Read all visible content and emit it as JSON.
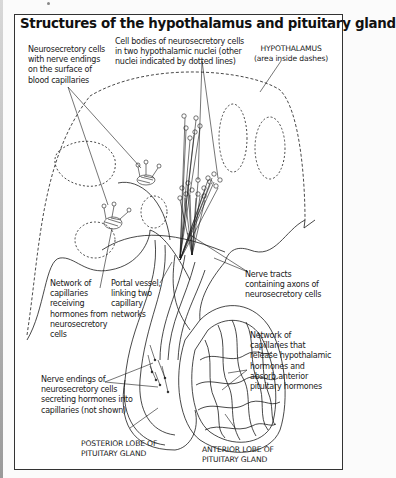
{
  "figure": {
    "title": "Structures of the hypothalamus and pituitary gland",
    "labels": {
      "neurosecretory_cells": "Neurosecretory cells\nwith nerve endings\non the surface of\nblood capillaries",
      "cell_bodies": "Cell bodies of neurosecretory cells\nin two hypothalamic nuclei (other\nnuclei indicated by dotted lines)",
      "hypothalamus": "HYPOTHALAMUS\n(area inside dashes)",
      "network_receiving": "Network of\ncapillaries\nreceiving\nhormones from\nneurosecretory\ncells",
      "portal_vessel": "Portal vessel,\nlinking two\ncapillary\nnetworks",
      "nerve_tracts": "Nerve tracts\ncontaining axons of\nneurosecretory cells",
      "network_release": "Network of\ncapillaries that\nrelease hypothalamic\nhormones and\nabsorb anterior\npituitary hormones",
      "nerve_endings": "Nerve endings of\nneurosecretory cells\nsecreting hormones into\ncapillaries (not shown)",
      "posterior_lobe": "POSTERIOR LOBE OF\nPITUITARY GLAND",
      "anterior_lobe": "ANTERIOR LOBE OF\nPITUITARY GLAND"
    },
    "colors": {
      "ink": "#1a1a1a",
      "frame": "#333333",
      "background": "#ffffff"
    }
  }
}
